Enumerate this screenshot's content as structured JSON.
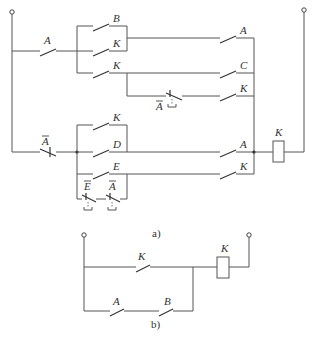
{
  "figure_a": {
    "caption": "a)",
    "labels": {
      "top_series_A": "A",
      "upper_B": "B",
      "upper_K1": "K",
      "upper_K2": "K",
      "upper_right_A": "A",
      "upper_right_C": "C",
      "upper_right_K": "K",
      "upper_nc_Abar": "A",
      "lower_series_Abar": "A",
      "lower_K": "K",
      "lower_D": "D",
      "lower_E": "E",
      "lower_nc_Ebar": "E",
      "lower_nc_Abar": "A",
      "lower_right_A": "A",
      "lower_right_K": "K",
      "coil": "K"
    }
  },
  "figure_b": {
    "caption": "b)",
    "labels": {
      "top_K": "K",
      "bottom_A": "A",
      "bottom_B": "B",
      "coil": "K"
    }
  }
}
